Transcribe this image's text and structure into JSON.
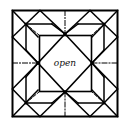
{
  "diagram": {
    "type": "origami-crease-pattern",
    "center_label": "open",
    "line_color": "#000000",
    "background": "#ffffff",
    "legend": {
      "solid": "fold line",
      "dash_dot": "midline crease",
      "dashed": "diagonal crease"
    }
  }
}
